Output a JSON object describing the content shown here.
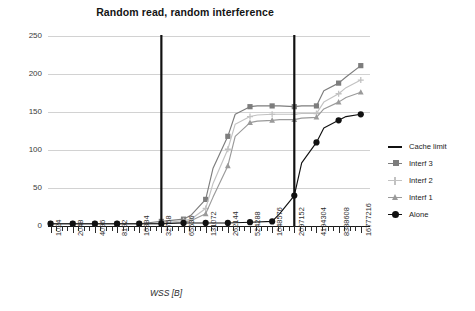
{
  "chart_data": {
    "type": "line",
    "title": "Random read, random interference",
    "xlabel": "WSS [B]",
    "ylabel": "Latency [ns]",
    "ylim": [
      0,
      250
    ],
    "yticks": [
      0,
      50,
      100,
      150,
      200,
      250
    ],
    "grid": true,
    "legend_position": "right",
    "x_scale": "log2",
    "categories": [
      1024,
      2048,
      4096,
      8192,
      16384,
      32768,
      65536,
      131072,
      262144,
      524288,
      1048576,
      2097152,
      4194304,
      8388608,
      16777216
    ],
    "xtick_labels": [
      "1024",
      "2048",
      "4096",
      "8192",
      "16384",
      "32768",
      "65536",
      "131072",
      "262144",
      "524288",
      "1048576",
      "2097152",
      "4194304",
      "8388608",
      "16777216"
    ],
    "minor_ticks_per_interval": 3,
    "annotations": [
      {
        "name": "cache-limit-1",
        "type": "vline",
        "x": 32768,
        "label": "Cache limit"
      },
      {
        "name": "cache-limit-2",
        "type": "vline",
        "x": 2097152,
        "label": "Cache limit"
      }
    ],
    "series": [
      {
        "name": "Interf 3",
        "color": "#7d7d7d",
        "marker": "square",
        "x": [
          1024,
          1625,
          2048,
          2580,
          4096,
          5160,
          8192,
          10321,
          16384,
          20642,
          32768,
          41285,
          65536,
          82570,
          131072,
          165140,
          262144,
          330280,
          524288,
          660560,
          1048576,
          1321120,
          2097152,
          2642240,
          4194304,
          5284480,
          8388608,
          10568960,
          16777216
        ],
        "values": [
          3,
          3,
          3,
          3,
          3,
          3,
          3,
          3,
          3,
          4,
          6,
          7,
          9,
          14,
          35,
          76,
          118,
          147,
          157,
          158,
          158,
          158,
          157,
          158,
          158,
          178,
          188,
          196,
          211
        ]
      },
      {
        "name": "Interf 2",
        "color": "#c2c2c2",
        "marker": "plus",
        "x": [
          1024,
          1625,
          2048,
          2580,
          4096,
          5160,
          8192,
          10321,
          16384,
          20642,
          32768,
          41285,
          65536,
          82570,
          131072,
          165140,
          262144,
          330280,
          524288,
          660560,
          1048576,
          1321120,
          2097152,
          2642240,
          4194304,
          5284480,
          8388608,
          10568960,
          16777216
        ],
        "values": [
          3,
          3,
          3,
          3,
          3,
          3,
          3,
          3,
          3,
          3,
          4,
          5,
          7,
          9,
          23,
          56,
          101,
          134,
          144,
          146,
          147,
          147,
          147,
          148,
          148,
          163,
          174,
          182,
          192
        ]
      },
      {
        "name": "Interf 1",
        "color": "#9a9a9a",
        "marker": "triangle",
        "x": [
          1024,
          1625,
          2048,
          2580,
          4096,
          5160,
          8192,
          10321,
          16384,
          20642,
          32768,
          41285,
          65536,
          82570,
          131072,
          165140,
          262144,
          330280,
          524288,
          660560,
          1048576,
          1321120,
          2097152,
          2642240,
          4194304,
          5284480,
          8388608,
          10568960,
          16777216
        ],
        "values": [
          3,
          3,
          3,
          3,
          3,
          3,
          3,
          3,
          3,
          3,
          3,
          4,
          5,
          7,
          16,
          38,
          79,
          118,
          136,
          138,
          139,
          140,
          140,
          142,
          143,
          154,
          163,
          169,
          176
        ]
      },
      {
        "name": "Alone",
        "color": "#111111",
        "marker": "circle",
        "x": [
          1024,
          2048,
          4096,
          8192,
          16384,
          32768,
          65536,
          131072,
          262144,
          524288,
          1048576,
          1321120,
          2097152,
          2642240,
          4194304,
          5284480,
          8388608,
          10568960,
          16777216
        ],
        "values": [
          3,
          3,
          3,
          3,
          3,
          3,
          4,
          4,
          4,
          5,
          6,
          16,
          40,
          83,
          110,
          129,
          139,
          144,
          147
        ]
      }
    ]
  },
  "legend": {
    "items": [
      {
        "label": "Cache limit",
        "marker": "line",
        "color": "#111111"
      },
      {
        "label": "Interf 3",
        "marker": "square",
        "color": "#7d7d7d"
      },
      {
        "label": "Interf 2",
        "marker": "plus",
        "color": "#c2c2c2"
      },
      {
        "label": "Interf 1",
        "marker": "triangle",
        "color": "#9a9a9a"
      },
      {
        "label": "Alone",
        "marker": "circle",
        "color": "#111111"
      }
    ]
  }
}
